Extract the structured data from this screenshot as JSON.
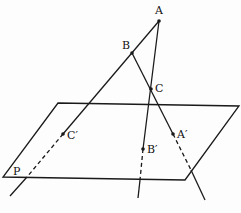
{
  "diagram": {
    "title": "",
    "type": "projection-of-triangle-onto-plane",
    "colors": {
      "stroke": "#1a1a1a",
      "background": "#fdfdfd"
    },
    "plane": {
      "label": "P",
      "corners": [
        [
          58,
          103
        ],
        [
          239,
          106
        ],
        [
          185,
          180
        ],
        [
          3,
          177
        ]
      ]
    },
    "points": [
      {
        "id": "A",
        "label": "A",
        "x": 159,
        "y": 21
      },
      {
        "id": "B",
        "label": "B",
        "x": 132,
        "y": 53
      },
      {
        "id": "C",
        "label": "C",
        "x": 151,
        "y": 89
      },
      {
        "id": "Cp",
        "label": "C′",
        "x": 63,
        "y": 134
      },
      {
        "id": "Bp",
        "label": "B′",
        "x": 143,
        "y": 149
      },
      {
        "id": "Ap",
        "label": "A′",
        "x": 173,
        "y": 134
      }
    ],
    "lines": [
      {
        "name": "line-AB-Cprime",
        "solid": [
          [
            159,
            21
          ],
          [
            63,
            134
          ]
        ],
        "dashed": [
          [
            63,
            134
          ],
          [
            27,
            177
          ]
        ],
        "tail": [
          [
            27,
            177
          ],
          [
            10,
            196
          ]
        ]
      },
      {
        "name": "line-AC-Bprime",
        "solid": [
          [
            159,
            21
          ],
          [
            143,
            149
          ]
        ],
        "dashed": [
          [
            143,
            149
          ],
          [
            140,
            180
          ]
        ],
        "tail": [
          [
            140,
            180
          ],
          [
            138,
            198
          ]
        ]
      },
      {
        "name": "line-BC-Aprime",
        "solid": [
          [
            132,
            53
          ],
          [
            173,
            134
          ]
        ],
        "dashed": [
          [
            173,
            134
          ],
          [
            191,
            170
          ]
        ],
        "tail": [
          [
            191,
            170
          ],
          [
            205,
            200
          ]
        ]
      }
    ]
  }
}
